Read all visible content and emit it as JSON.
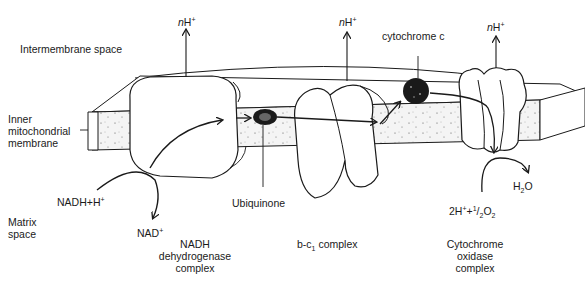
{
  "regions": {
    "intermembrane": "Intermembrane space",
    "inner_membrane": [
      "Inner",
      "mitochondrial",
      "membrane"
    ],
    "matrix": [
      "Matrix",
      "space"
    ]
  },
  "proton_pumps": [
    {
      "prefix": "n",
      "ion": "H",
      "charge": "+"
    },
    {
      "prefix": "n",
      "ion": "H",
      "charge": "+"
    },
    {
      "prefix": "n",
      "ion": "H",
      "charge": "+"
    }
  ],
  "carriers": {
    "cytochrome_c": "cytochrome c",
    "ubiquinone": "Ubiquinone"
  },
  "reactions": {
    "nadh_in": {
      "text": "NADH+H",
      "charge": "+"
    },
    "nad_out": {
      "text": "NAD",
      "charge": "+"
    },
    "water": {
      "pre": "H",
      "sub": "2",
      "post": "O"
    },
    "oxygen": {
      "a": "2H",
      "charge": "+",
      "b": "+",
      "num": "1",
      "den": "2",
      "c": "O",
      "sub": "2"
    }
  },
  "complexes": {
    "nadh": [
      "NADH",
      "dehydrogenase",
      "complex"
    ],
    "bc1": {
      "pre": "b-c",
      "sub": "1",
      "post": " complex"
    },
    "oxidase": [
      "Cytochrome",
      "oxidase",
      "complex"
    ]
  },
  "colors": {
    "ink": "#1a1a1a",
    "background": "#ffffff",
    "membrane_fill": "#f4f4f4"
  }
}
